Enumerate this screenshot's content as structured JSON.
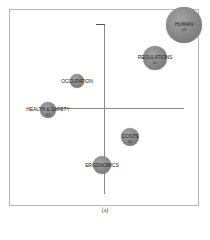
{
  "chart_data": {
    "type": "scatter",
    "subtype": "bubble",
    "title": "",
    "xlabel": "",
    "ylabel": "",
    "legend": "none",
    "grid": false,
    "quadrant_axes": true,
    "points": [
      {
        "label": "HUMAN",
        "value": "09",
        "x": 184,
        "y": 25,
        "r": 18
      },
      {
        "label": "REGULATIONS",
        "value": "41",
        "x": 155,
        "y": 58,
        "r": 12
      },
      {
        "label": "OCCUPATION",
        "value": "",
        "x": 77,
        "y": 81,
        "r": 7
      },
      {
        "label": "HEALTH & SAFETY",
        "value": "01",
        "x": 48,
        "y": 110,
        "r": 8
      },
      {
        "label": "COSTS",
        "value": "26",
        "x": 130,
        "y": 137,
        "r": 9
      },
      {
        "label": "ERGONOMICS",
        "value": "",
        "x": 102,
        "y": 165,
        "r": 9
      }
    ]
  },
  "caption": "(a)"
}
